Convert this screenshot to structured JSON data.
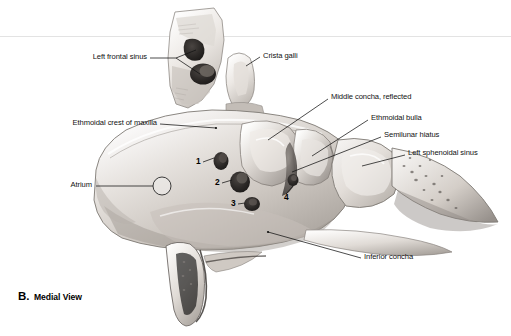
{
  "figure": {
    "caption_letter": "B.",
    "caption_text": "Medial View",
    "view_type": "medial view of lateral nasal wall"
  },
  "labels": [
    {
      "id": "left-frontal-sinus",
      "text": "Left frontal sinus",
      "side": "right",
      "x": 147,
      "y": 60
    },
    {
      "id": "crista-galli",
      "text": "Crista galli",
      "side": "left",
      "x": 263,
      "y": 57
    },
    {
      "id": "ethmoidal-crest-of-maxilla",
      "text": "Ethmoidal crest of maxilla",
      "side": "right",
      "x": 157,
      "y": 125
    },
    {
      "id": "middle-concha-reflected",
      "text": "Middle concha, reflected",
      "side": "left",
      "x": 331,
      "y": 98
    },
    {
      "id": "ethmoidal-bulla",
      "text": "Ethmoidal bulla",
      "side": "left",
      "x": 371,
      "y": 120
    },
    {
      "id": "semilunar-hiatus",
      "text": "Semilunar hiatus",
      "side": "left",
      "x": 384,
      "y": 136
    },
    {
      "id": "left-sphenoidal-sinus",
      "text": "Left sphenoidal sinus",
      "side": "left",
      "x": 408,
      "y": 154
    },
    {
      "id": "atrium",
      "text": "Atrium",
      "side": "right",
      "x": 92,
      "y": 187
    },
    {
      "id": "inferior-concha",
      "text": "Inferior concha",
      "side": "left",
      "x": 364,
      "y": 259
    }
  ],
  "numbered_markers": [
    {
      "id": "marker-1",
      "text": "1",
      "x": 196,
      "y": 163
    },
    {
      "id": "marker-2",
      "text": "2",
      "x": 215,
      "y": 184
    },
    {
      "id": "marker-3",
      "text": "3",
      "x": 231,
      "y": 205
    },
    {
      "id": "marker-4",
      "text": "4",
      "x": 284,
      "y": 198
    }
  ],
  "colors": {
    "background": "#ffffff",
    "line": "#111111",
    "text": "#111111",
    "rule": "#e3e3e3",
    "bone_light": "#f2f0ee",
    "bone_mid": "#cfcac5",
    "bone_shadow": "#8d8884",
    "cavity_dark": "#2b2826"
  }
}
